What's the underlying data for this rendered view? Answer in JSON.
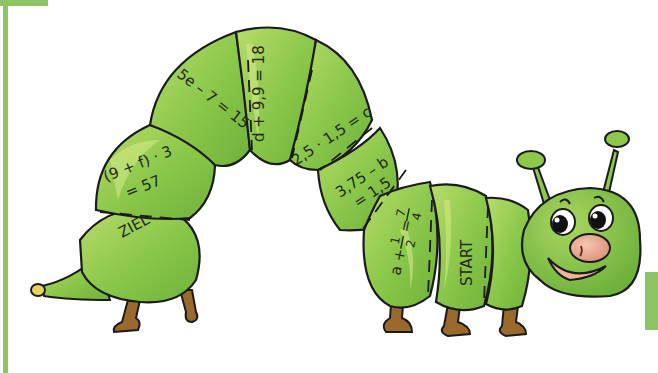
{
  "illustration": {
    "subject": "caterpillar",
    "colors": {
      "body": "#8cc84b",
      "body_light": "#c4e07a",
      "outline": "#1b1b1b",
      "legs": "#9a6a2c",
      "nose": "#e8a58c",
      "accent_bar": "#8cc564"
    }
  },
  "segments": [
    {
      "id": "ziel",
      "label": "ZIEL"
    },
    {
      "id": "seg-f-line1",
      "label": "(9 + f) · 3"
    },
    {
      "id": "seg-f-line2",
      "label": "= 57"
    },
    {
      "id": "seg-e",
      "label": "5e – 7 = 15"
    },
    {
      "id": "seg-d",
      "label": "d + 9,9 = 18"
    },
    {
      "id": "seg-c",
      "label": "2,5 · 1,5 = c"
    },
    {
      "id": "seg-b-line1",
      "label": "3,75 – b"
    },
    {
      "id": "seg-b-line2",
      "label": "= 1,5"
    },
    {
      "id": "seg-a-prefix",
      "label": "a +"
    },
    {
      "id": "seg-a-num",
      "label": "1"
    },
    {
      "id": "seg-a-den",
      "label": "2"
    },
    {
      "id": "seg-a-eq",
      "label": "="
    },
    {
      "id": "seg-a-rnum",
      "label": "7"
    },
    {
      "id": "seg-a-rden",
      "label": "4"
    },
    {
      "id": "start",
      "label": "START"
    }
  ]
}
